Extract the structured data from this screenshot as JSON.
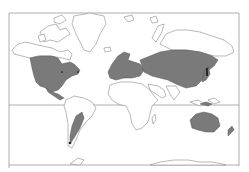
{
  "map": {
    "type": "world-distribution-map",
    "projection": "mercator",
    "colors": {
      "background": "#ffffff",
      "land_outline": "#8a8a8a",
      "land_fill": "#ffffff",
      "range_fill": "#7a7a7a",
      "range_stroke": "#555555",
      "frame": "#9a9a9a",
      "equator": "#9a9a9a",
      "dark_spots": "#2a2a2a"
    },
    "frame": {
      "left": 9,
      "top": 13,
      "right": 239,
      "bottom": 165
    },
    "equator_y": 105,
    "shaded_regions": [
      "north-america-temperate",
      "central-america",
      "europe",
      "northern-asia",
      "east-asia",
      "southern-south-america",
      "australia",
      "new-zealand",
      "southeast-asia-islands"
    ]
  }
}
